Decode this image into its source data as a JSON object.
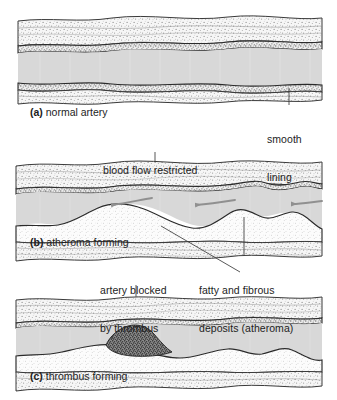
{
  "figure": {
    "background_color": "#ffffff",
    "ink_color": "#1d1d1d",
    "lumen_color": "#d8d8d8",
    "wall_color": "#f2f2f2",
    "arrow_color": "#909090",
    "deposit_color": "#fdfdfd",
    "thrombus_color": "#4a4a4a"
  },
  "panels": [
    {
      "id": "a",
      "tag": "(a)",
      "caption": "normal artery",
      "caption_full": "(a) normal artery"
    },
    {
      "id": "b",
      "tag": "(b)",
      "caption": "atheroma forming",
      "caption_full": "(b) atheroma forming"
    },
    {
      "id": "c",
      "tag": "(c)",
      "caption": "thrombus forming",
      "caption_full": "(c) thrombus forming"
    }
  ],
  "labels": {
    "smooth_lining": {
      "line1": "smooth",
      "line2": "lining",
      "text": "smooth lining"
    },
    "blood_flow_restricted": {
      "line1": "blood flow restricted",
      "text": "blood flow restricted"
    },
    "artery_blocked": {
      "line1": "artery blocked",
      "line2": "by thrombus",
      "text": "artery blocked by thrombus"
    },
    "fatty_deposits": {
      "line1": "fatty and fibrous",
      "line2": "deposits (atheroma)",
      "text": "fatty and fibrous deposits (atheroma)"
    }
  },
  "flow_arrows": {
    "count": 3,
    "direction": "left",
    "meaning": "blood flow direction"
  }
}
